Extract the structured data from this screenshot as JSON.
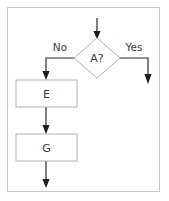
{
  "diagram": {
    "frame": {
      "border_color": "#c9c9c9",
      "background_color": "#ffffff"
    },
    "style": {
      "shape_fill": "#ffffff",
      "shape_stroke": "#b2b2b2",
      "connector_color": "#2b2b2b",
      "text_color": "#3a3a3a"
    },
    "nodes": [
      {
        "id": "decision-a",
        "type": "decision",
        "label": "A?",
        "shape": "diamond",
        "cx": 97,
        "cy": 58,
        "rx": 23,
        "ry": 20
      },
      {
        "id": "process-e",
        "type": "process",
        "label": "E",
        "shape": "rectangle",
        "x": 16,
        "y": 80,
        "width": 61,
        "height": 27
      },
      {
        "id": "process-g",
        "type": "process",
        "label": "G",
        "shape": "rectangle",
        "x": 16,
        "y": 134,
        "width": 61,
        "height": 27
      }
    ],
    "edges": [
      {
        "id": "edge-entry",
        "from": "",
        "to": "decision-a",
        "label": "",
        "path": "M 97 18 L 97 36"
      },
      {
        "id": "edge-no",
        "from": "decision-a",
        "to": "process-e",
        "label": "No",
        "path": "M 74 58 L 46 58 L 46 76"
      },
      {
        "id": "edge-yes",
        "from": "decision-a",
        "to": "",
        "label": "Yes",
        "path": "M 120 58 L 148 58 L 148 80"
      },
      {
        "id": "edge-e-to-g",
        "from": "process-e",
        "to": "process-g",
        "label": "",
        "path": "M 46 107 L 46 130"
      },
      {
        "id": "edge-g-out",
        "from": "process-g",
        "to": "",
        "label": "",
        "path": "M 46 161 L 46 184"
      }
    ],
    "labels": {
      "no": "No",
      "yes": "Yes",
      "decision": "A?",
      "node_e": "E",
      "node_g": "G"
    }
  }
}
